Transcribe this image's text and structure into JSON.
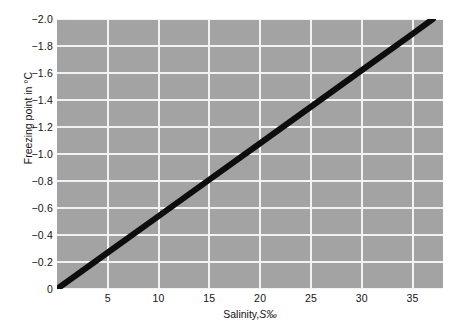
{
  "chart_data": {
    "type": "line",
    "title": "",
    "xlabel": "Salinity, S‰",
    "xlabel_plain": "Salinity,",
    "xlabel_symbol": "S‰",
    "ylabel": "Freezing point in °C",
    "xlim": [
      0,
      38
    ],
    "ylim": [
      0,
      -2.0
    ],
    "y_axis_inverted": true,
    "xticks": [
      5,
      10,
      15,
      20,
      25,
      30,
      35
    ],
    "xtick_labels": [
      "5",
      "10",
      "15",
      "20",
      "25",
      "30",
      "35"
    ],
    "yticks": [
      -2.0,
      -1.8,
      -1.6,
      -1.4,
      -1.2,
      -1.0,
      -0.8,
      -0.6,
      -0.4,
      -0.2,
      0
    ],
    "ytick_labels": [
      "−2.0",
      "−1.8",
      "−1.6",
      "−1.4",
      "−1.2",
      "−1.0",
      "−0.8",
      "−0.6",
      "−0.4",
      "−0.2",
      "0"
    ],
    "grid": true,
    "grid_color": "#f2f2f2",
    "plot_background": "#a3a3a3",
    "legend": null,
    "series": [
      {
        "name": "Freezing point of seawater",
        "color": "#0d0d0d",
        "linewidth": 6,
        "x": [
          0,
          5,
          10,
          15,
          20,
          25,
          30,
          35,
          37
        ],
        "y": [
          0,
          -0.27,
          -0.54,
          -0.81,
          -1.08,
          -1.35,
          -1.62,
          -1.89,
          -2.0
        ]
      }
    ]
  }
}
